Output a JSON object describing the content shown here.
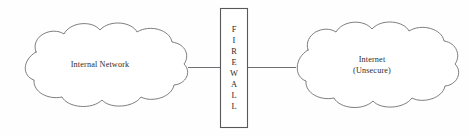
{
  "diagram": {
    "background_color": "#fefefe",
    "stroke_color": "#6e6e72",
    "text_color": "#2b2b2b",
    "nodes": {
      "internal_network": {
        "label": "Internal Network",
        "shape": "cloud"
      },
      "internet": {
        "label": "Internet\n(Unsecure)",
        "label_line1": "Internet",
        "label_line2": "(Unsecure)",
        "shape": "cloud"
      },
      "firewall": {
        "label": "FIREWALL",
        "shape": "rectangle",
        "orientation": "vertical",
        "letters": [
          "F",
          "I",
          "R",
          "E",
          "W",
          "A",
          "L",
          "L"
        ]
      }
    },
    "connectors": [
      {
        "name": "internal-to-firewall",
        "from": "internal_network",
        "to": "firewall",
        "style": "plain-line"
      },
      {
        "name": "firewall-to-internet",
        "from": "firewall",
        "to": "internet",
        "style": "plain-line"
      }
    ]
  }
}
